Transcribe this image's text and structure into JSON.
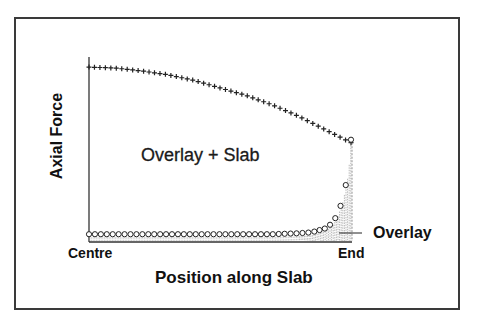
{
  "chart_data": {
    "type": "line",
    "title": "",
    "xlabel": "Position along Slab",
    "ylabel": "Axial Force",
    "x_ticks": [
      "Centre",
      "End"
    ],
    "xlim": [
      0,
      1
    ],
    "ylim": [
      0,
      1
    ],
    "grid": false,
    "legend": "none (inline annotations)",
    "annotations": [
      "Overlay + Slab",
      "Overlay"
    ],
    "series": [
      {
        "name": "Overlay + Slab",
        "marker": "plus",
        "x": [
          0.0,
          0.1,
          0.2,
          0.3,
          0.4,
          0.5,
          0.6,
          0.7,
          0.8,
          0.9,
          1.0
        ],
        "values": [
          0.92,
          0.915,
          0.9,
          0.88,
          0.85,
          0.81,
          0.77,
          0.72,
          0.66,
          0.59,
          0.52
        ]
      },
      {
        "name": "Overlay",
        "marker": "circle",
        "style": "hatched fill under curve",
        "x": [
          0.0,
          0.1,
          0.2,
          0.3,
          0.4,
          0.5,
          0.6,
          0.7,
          0.8,
          0.85,
          0.9,
          0.93,
          0.95,
          0.97,
          0.99,
          1.0
        ],
        "values": [
          0.02,
          0.02,
          0.02,
          0.02,
          0.02,
          0.02,
          0.02,
          0.02,
          0.025,
          0.03,
          0.05,
          0.08,
          0.13,
          0.21,
          0.35,
          0.52
        ]
      }
    ]
  },
  "labels": {
    "ylabel": "Axial Force",
    "xlabel": "Position along Slab",
    "tick_start": "Centre",
    "tick_end": "End",
    "annotation_combined": "Overlay + Slab",
    "annotation_overlay": "Overlay"
  }
}
